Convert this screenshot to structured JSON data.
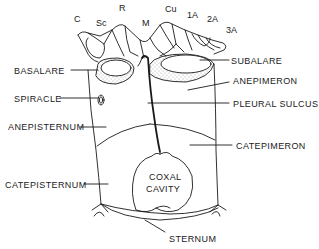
{
  "diagram": {
    "type": "insect pterothoracic pleuron (lateral view)",
    "wing_vein_labels": [
      {
        "id": "c",
        "text": "C",
        "x": 74,
        "y": 14
      },
      {
        "id": "sc",
        "text": "Sc",
        "x": 96,
        "y": 18
      },
      {
        "id": "r",
        "text": "R",
        "x": 119,
        "y": 3
      },
      {
        "id": "m",
        "text": "M",
        "x": 142,
        "y": 18
      },
      {
        "id": "cu",
        "text": "Cu",
        "x": 165,
        "y": 4
      },
      {
        "id": "1a",
        "text": "1A",
        "x": 187,
        "y": 10
      },
      {
        "id": "2a",
        "text": "2A",
        "x": 207,
        "y": 14
      },
      {
        "id": "3a",
        "text": "3A",
        "x": 226,
        "y": 25
      }
    ],
    "left_labels": [
      {
        "id": "basalare",
        "text": "BASALARE",
        "x": 14,
        "y": 66
      },
      {
        "id": "spiracle",
        "text": "SPIRACLE",
        "x": 14,
        "y": 94
      },
      {
        "id": "anepisternum",
        "text": "ANEPISTERNUM",
        "x": 10,
        "y": 122
      },
      {
        "id": "catepisternum",
        "text": "CATEPISTERNUM",
        "x": 6,
        "y": 180
      }
    ],
    "right_labels": [
      {
        "id": "subalare",
        "text": "SUBALARE",
        "x": 231,
        "y": 56
      },
      {
        "id": "anepimeron",
        "text": "ANEPIMERON",
        "x": 233,
        "y": 76
      },
      {
        "id": "pleural_sulcus",
        "text": "PLEURAL SULCUS",
        "x": 233,
        "y": 99
      },
      {
        "id": "catepimeron",
        "text": "CATEPIMERON",
        "x": 237,
        "y": 141
      }
    ],
    "center_labels": [
      {
        "id": "coxal_cavity_1",
        "text": "COXAL",
        "x": 147,
        "y": 172
      },
      {
        "id": "coxal_cavity_2",
        "text": "CAVITY",
        "x": 146,
        "y": 184
      }
    ],
    "bottom_labels": [
      {
        "id": "sternum",
        "text": "STERNUM",
        "x": 169,
        "y": 236
      }
    ],
    "colors": {
      "ink": "#1a1a1a",
      "background": "#ffffff",
      "stipple": "#8a8a8a"
    }
  }
}
